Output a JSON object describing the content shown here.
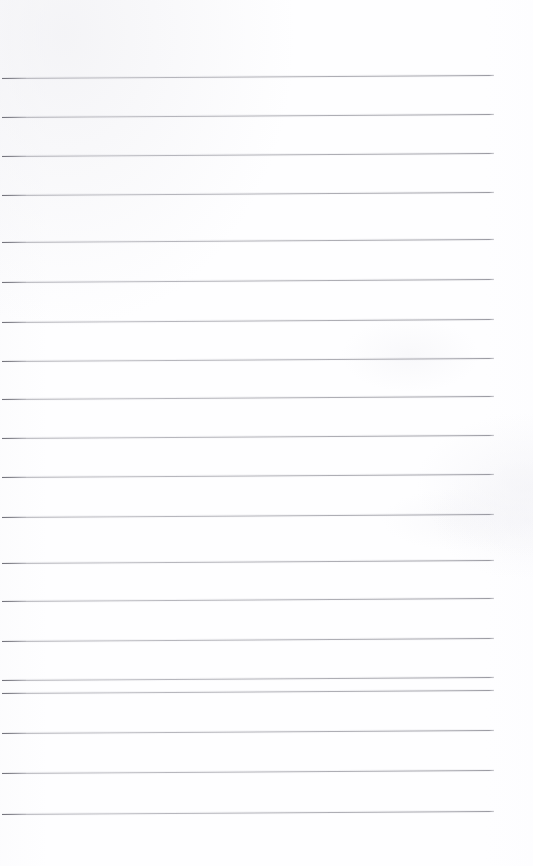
{
  "document": {
    "kind": "lined-notebook-page",
    "title": "Blank ruled paper",
    "page_width": 533,
    "page_height": 866,
    "background_color": "#fefeff",
    "rule_color": "#9a9aa0",
    "rule_thickness_px": 1,
    "content_text": "",
    "notes": "Empty ruled page: no handwriting, headings, page numbers or margins rule present."
  },
  "layout": {
    "rule_start_x": 2,
    "rule_end_x": 494,
    "top_margin_px": 78,
    "bottom_margin_px": 51,
    "right_margin_px": 39,
    "line_spacing_px": 38.8,
    "line_count": 20,
    "slant_px": 3
  },
  "rules": [
    {
      "index": 1,
      "y": 78,
      "x1": 2,
      "x2": 494
    },
    {
      "index": 2,
      "y": 117,
      "x1": 2,
      "x2": 494
    },
    {
      "index": 3,
      "y": 156,
      "x1": 2,
      "x2": 494
    },
    {
      "index": 4,
      "y": 195,
      "x1": 2,
      "x2": 494
    },
    {
      "index": 5,
      "y": 242,
      "x1": 2,
      "x2": 494
    },
    {
      "index": 6,
      "y": 282,
      "x1": 2,
      "x2": 494
    },
    {
      "index": 7,
      "y": 322,
      "x1": 2,
      "x2": 494
    },
    {
      "index": 8,
      "y": 361,
      "x1": 2,
      "x2": 494
    },
    {
      "index": 9,
      "y": 399,
      "x1": 2,
      "x2": 494
    },
    {
      "index": 10,
      "y": 438,
      "x1": 2,
      "x2": 494
    },
    {
      "index": 11,
      "y": 477,
      "x1": 2,
      "x2": 494
    },
    {
      "index": 12,
      "y": 517,
      "x1": 2,
      "x2": 494
    },
    {
      "index": 13,
      "y": 563,
      "x1": 2,
      "x2": 494
    },
    {
      "index": 14,
      "y": 601,
      "x1": 2,
      "x2": 494
    },
    {
      "index": 15,
      "y": 641,
      "x1": 2,
      "x2": 494
    },
    {
      "index": 16,
      "y": 680,
      "x1": 2,
      "x2": 494
    },
    {
      "index": 17,
      "y": 693,
      "x1": 2,
      "x2": 494
    },
    {
      "index": 18,
      "y": 733,
      "x1": 2,
      "x2": 494
    },
    {
      "index": 19,
      "y": 773,
      "x1": 2,
      "x2": 494
    },
    {
      "index": 20,
      "y": 814,
      "x1": 2,
      "x2": 494
    }
  ]
}
